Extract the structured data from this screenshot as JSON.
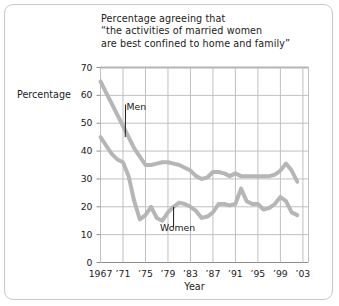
{
  "figure": {
    "background": "#ffffff",
    "frame_color": "#c9c9c9"
  },
  "chart_data": {
    "type": "line",
    "title_lines": [
      "Percentage agreeing that",
      "“the activities of married women",
      "are best confined to home and family”"
    ],
    "xlabel": "Year",
    "ylabel": "Percentage",
    "ylim": [
      0,
      70
    ],
    "xlim": [
      1967,
      2004
    ],
    "yticks": [
      70,
      60,
      50,
      40,
      30,
      20,
      10,
      0
    ],
    "ytick_labels": [
      "70",
      "60",
      "50",
      "40",
      "30",
      "20",
      "10",
      "0"
    ],
    "xticks": [
      1967,
      1971,
      1975,
      1979,
      1983,
      1987,
      1991,
      1995,
      1999,
      2003
    ],
    "xtick_labels": [
      "1967",
      "’71",
      "’75",
      "’79",
      "’83",
      "’87",
      "’91",
      "’95",
      "’99",
      "’03"
    ],
    "grid": true,
    "grid_color": "#c0c0c0",
    "legend": "annotations",
    "line_color": "#b6b6b6",
    "line_width": 4,
    "x": [
      1967,
      1968,
      1969,
      1970,
      1971,
      1972,
      1973,
      1974,
      1975,
      1976,
      1977,
      1978,
      1979,
      1980,
      1981,
      1982,
      1983,
      1984,
      1985,
      1986,
      1987,
      1988,
      1989,
      1990,
      1991,
      1992,
      1993,
      1994,
      1995,
      1996,
      1997,
      1998,
      1999,
      2000,
      2001,
      2002
    ],
    "series": [
      {
        "name": "Men",
        "label": "Men",
        "color": "#b6b6b6",
        "values": [
          65,
          61,
          57,
          53,
          49,
          45,
          41,
          38,
          35,
          35,
          35.5,
          36,
          36,
          35.5,
          35,
          34,
          33,
          31,
          30,
          30.5,
          32.5,
          32.5,
          32,
          31,
          32,
          31,
          31,
          31,
          31,
          31,
          31,
          31.5,
          33,
          35.5,
          33,
          29
        ],
        "annotation": {
          "label": "Men",
          "label_x": 1972,
          "label_y": 56,
          "leader_to_x": 1971.4,
          "leader_to_y": 45
        }
      },
      {
        "name": "Women",
        "label": "Women",
        "color": "#b6b6b6",
        "values": [
          45,
          42,
          39,
          37,
          36,
          31,
          22,
          15.5,
          17,
          20,
          16,
          15,
          18,
          20,
          21.5,
          21,
          20,
          18.5,
          16,
          16.5,
          18,
          21,
          21,
          20.5,
          21,
          26.5,
          22,
          21,
          21,
          19,
          19.5,
          21,
          23.5,
          22,
          18,
          17
        ],
        "annotation": {
          "label": "Women",
          "label_x": 1980,
          "label_y": 13,
          "leader_to_x": 1980,
          "leader_to_y": 20
        }
      }
    ]
  }
}
